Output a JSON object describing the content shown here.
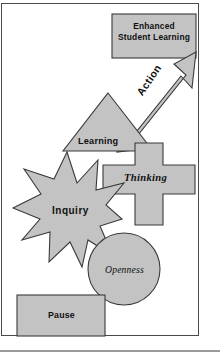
{
  "diagram": {
    "frame": {
      "border_color": "#4a4a4a",
      "background": "#ffffff"
    },
    "style": {
      "shape_fill": "#c3c3c3",
      "shape_stroke": "#3a3a3a",
      "text_color": "#111111"
    },
    "nodes": [
      {
        "id": "goal",
        "label": "Enhanced\nStudent Learning",
        "line1": "Enhanced",
        "line2": "Student Learning",
        "shape": "rectangle",
        "x": 112,
        "y": 14,
        "w": 84,
        "h": 44
      },
      {
        "id": "action",
        "label": "Action",
        "shape": "arrow",
        "x": 118,
        "y": 58,
        "w": 78,
        "h": 95
      },
      {
        "id": "learning",
        "label": "Learning",
        "shape": "triangle",
        "x": 63,
        "y": 93,
        "w": 90,
        "h": 58
      },
      {
        "id": "thinking",
        "label": "Thinking",
        "shape": "cross",
        "x": 103,
        "y": 143,
        "w": 92,
        "h": 82
      },
      {
        "id": "inquiry",
        "label": "Inquiry",
        "shape": "star-12",
        "x": 12,
        "y": 152,
        "w": 110,
        "h": 115
      },
      {
        "id": "openness",
        "label": "Openness",
        "shape": "circle",
        "x": 88,
        "y": 233,
        "w": 72,
        "h": 72
      },
      {
        "id": "pause",
        "label": "Pause",
        "shape": "rectangle",
        "x": 17,
        "y": 295,
        "w": 88,
        "h": 41
      }
    ],
    "sequence": [
      "Pause",
      "Openness",
      "Inquiry",
      "Thinking",
      "Learning",
      "Action",
      "Enhanced Student Learning"
    ]
  }
}
